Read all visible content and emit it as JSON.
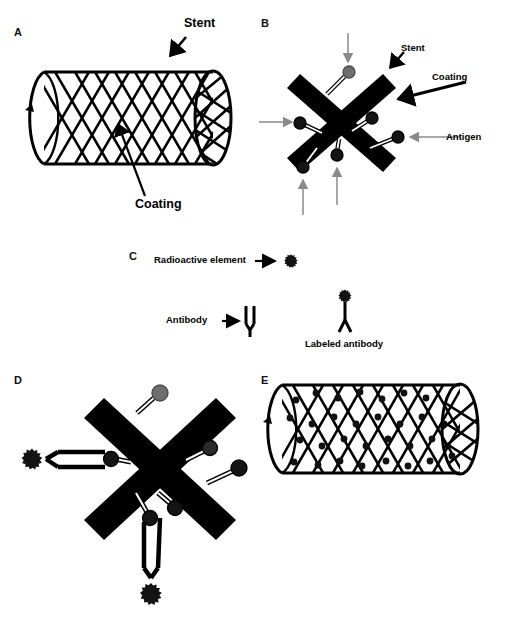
{
  "figure": {
    "background_color": "#ffffff",
    "ink_color": "#000000",
    "antigen_color": "#1a1a1a",
    "coating_gray": "#6e6e6e",
    "arrow_gray": "#8a8a8a"
  },
  "panels": {
    "a": {
      "letter": "A",
      "labels": {
        "stent": "Stent",
        "coating": "Coating"
      }
    },
    "b": {
      "letter": "B",
      "labels": {
        "stent": "Stent",
        "coating": "Coating",
        "antigen": "Antigen"
      }
    },
    "c": {
      "letter": "C",
      "labels": {
        "radioactive_element": "Radioactive element",
        "antibody": "Antibody",
        "labeled_antibody": "Labeled antibody"
      }
    },
    "d": {
      "letter": "D"
    },
    "e": {
      "letter": "E"
    }
  }
}
